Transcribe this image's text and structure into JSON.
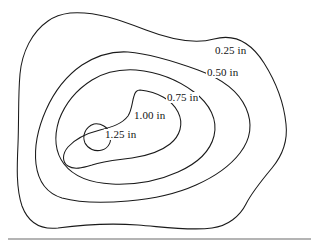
{
  "figure": {
    "type": "contour-map",
    "title": "",
    "background_color": "#ffffff",
    "line_color": "#1a1a1a",
    "rule_color": "#6b6b6b",
    "unit": "in",
    "labels": [
      {
        "id": "label-0",
        "text": "0.25 in",
        "value": "0.25",
        "unit": "in"
      },
      {
        "id": "label-1",
        "text": "0.50 in",
        "value": "0.50",
        "unit": "in"
      },
      {
        "id": "label-2",
        "text": "0.75 in",
        "value": "0.75",
        "unit": "in"
      },
      {
        "id": "label-3",
        "text": "1.00 in",
        "value": "1.00",
        "unit": "in"
      },
      {
        "id": "label-4",
        "text": "1.25 in",
        "value": "1.25",
        "unit": "in"
      }
    ]
  },
  "chart_data": {
    "type": "line",
    "title": "",
    "subtitle": "",
    "xlabel": "",
    "ylabel": "",
    "grid": false,
    "legend_position": "inline-labels",
    "contour_unit": "in",
    "contour_levels": [
      0.25,
      0.5,
      0.75,
      1.0,
      1.25
    ],
    "level_labels": [
      "0.25 in",
      "0.50 in",
      "0.75 in",
      "1.00 in",
      "1.25 in"
    ],
    "annotations": [
      {
        "text": "0.25 in",
        "x": 214,
        "y": 45
      },
      {
        "text": "0.50 in",
        "x": 206,
        "y": 67
      },
      {
        "text": "0.75 in",
        "x": 166,
        "y": 92
      },
      {
        "text": "1.00 in",
        "x": 133,
        "y": 110
      },
      {
        "text": "1.25 in",
        "x": 104,
        "y": 129
      }
    ],
    "series": [
      {
        "name": "0.25 in",
        "value": 0.25,
        "closed": true,
        "path": "M 70 13 C 96 11 120 20 146 30 C 172 40 196 44 214 39 C 236 33 252 44 264 63 C 276 82 284 104 286 124 C 288 142 282 156 272 168 C 262 180 252 192 246 204 C 240 216 228 226 212 228 C 190 231 164 227 138 225 C 110 223 80 225 58 228 C 40 230 28 222 22 206 C 16 188 17 166 18 144 C 19 120 18 96 20 74 C 22 52 32 32 48 21 C 55 16 62 14 70 13 Z"
      },
      {
        "name": "0.50 in",
        "value": 0.5,
        "closed": true,
        "path": "M 128 52 C 152 54 176 62 198 70 C 220 78 238 90 246 108 C 253 124 250 140 240 153 C 230 166 214 177 196 185 C 176 194 152 199 128 201 C 104 203 80 203 62 198 C 46 193 38 180 36 164 C 34 146 38 128 46 110 C 54 92 66 76 82 65 C 96 56 112 51 128 52 Z"
      },
      {
        "name": "0.75 in",
        "value": 0.75,
        "closed": true,
        "path": "M 136 70 C 158 72 178 80 194 92 C 210 104 218 120 214 136 C 210 152 196 164 178 172 C 158 181 134 185 112 184 C 92 183 74 177 64 164 C 55 152 54 136 59 120 C 65 104 76 90 92 80 C 105 72 120 69 136 70 Z"
      },
      {
        "name": "1.00 in",
        "value": 1.0,
        "closed": true,
        "path": "M 140 90 C 158 92 172 100 178 112 C 184 124 180 136 170 144 C 160 152 146 156 132 158 C 118 160 104 161 92 165 C 82 168 74 170 68 166 C 62 162 62 154 68 147 C 76 138 88 133 100 130 C 112 127 122 124 128 116 C 132 110 132 102 134 96 C 135 92 137 90 140 90 Z"
      },
      {
        "name": "1.25 in",
        "value": 1.25,
        "closed": true,
        "path": "M 94 124 C 101 123 108 127 110 134 C 112 141 109 148 102 150 C 95 152 88 149 85 143 C 82 136 85 127 94 124 Z"
      }
    ],
    "baseline_rule": {
      "x1": 8,
      "y1": 239,
      "x2": 311,
      "y2": 239
    }
  }
}
